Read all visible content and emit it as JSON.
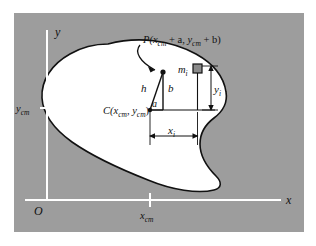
{
  "figure": {
    "frame": {
      "background_color": "#9d9d9d",
      "border_color": "#ffffff",
      "page_color": "#ffffff"
    },
    "body_shape": {
      "name": "irregular-lamina",
      "fill_color": "#ffffff",
      "stroke_color": "#111111"
    },
    "axes": {
      "color": "#ffffff",
      "origin_label": "O",
      "x_axis_label": "x",
      "y_axis_label": "y",
      "x_tick_label": "x",
      "x_tick_sub": "cm",
      "y_tick_label": "y",
      "y_tick_sub": "cm"
    },
    "labels": {
      "point_p": {
        "lead": "P(",
        "x_base": "x",
        "x_sub": "cm",
        "plus_a": " + a, ",
        "y_base": "y",
        "y_sub": "cm",
        "plus_b": " + b)",
        "full_text": "P(xcm + a, ycm + b)"
      },
      "point_c": {
        "lead": "C(",
        "x_base": "x",
        "x_sub": "cm",
        "comma": ", ",
        "y_base": "y",
        "y_sub": "cm",
        "close": ")",
        "full_text": "C(xcm, ycm)"
      },
      "mass_element": {
        "base": "m",
        "sub": "i",
        "full_text": "mi"
      },
      "side_h": "h",
      "side_a": "a",
      "side_b": "b",
      "dim_x": {
        "base": "x",
        "sub": "i",
        "full_text": "xi"
      },
      "dim_y": {
        "base": "y",
        "sub": "i",
        "full_text": "yi"
      }
    },
    "markers": {
      "mass_square_color": "#8a8a8a",
      "mass_square_stroke": "#111111",
      "dot_color": "#111111"
    }
  }
}
